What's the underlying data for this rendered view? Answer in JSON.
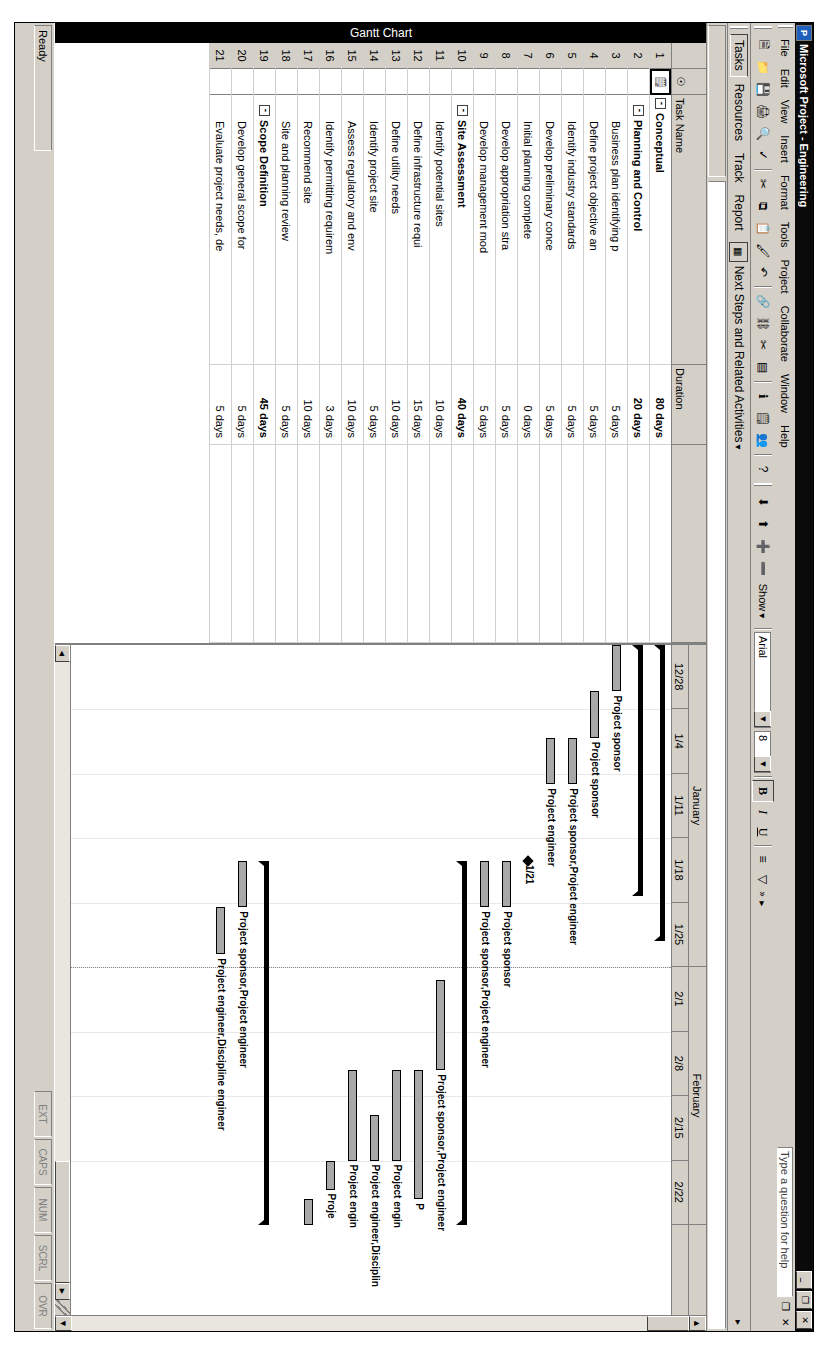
{
  "window": {
    "title": "Microsoft Project - Engineering",
    "app_icon": "project-icon",
    "minimize_label": "_",
    "restore_label": "❐",
    "close_label": "✕"
  },
  "menubar": {
    "items": [
      "File",
      "Edit",
      "View",
      "Insert",
      "Format",
      "Tools",
      "Project",
      "Collaborate",
      "Window",
      "Help"
    ],
    "ask_a_question": "Type a question for help",
    "doc_restore_label": "❐",
    "doc_close_label": "✕",
    "overflow_label": "»"
  },
  "standard_toolbar": {
    "buttons": [
      {
        "name": "new-icon",
        "glyph": "⬜"
      },
      {
        "name": "open-icon",
        "glyph": "🗁"
      },
      {
        "name": "save-icon",
        "glyph": "💾"
      },
      {
        "name": "print-icon",
        "glyph": "🖨"
      },
      {
        "name": "print-preview-icon",
        "glyph": "🔍"
      },
      {
        "name": "spelling-icon",
        "glyph": "✓"
      },
      {
        "name": "cut-icon",
        "glyph": "✂"
      },
      {
        "name": "copy-icon",
        "glyph": "⧉"
      },
      {
        "name": "paste-icon",
        "glyph": "📋"
      },
      {
        "name": "format-painter-icon",
        "glyph": "🖌"
      },
      {
        "name": "undo-icon",
        "glyph": "↶"
      },
      {
        "name": "hyperlink-icon",
        "glyph": "🔗"
      },
      {
        "name": "link-tasks-icon",
        "glyph": "⛓"
      },
      {
        "name": "unlink-tasks-icon",
        "glyph": "✂"
      },
      {
        "name": "split-task-icon",
        "glyph": "▤"
      },
      {
        "name": "task-information-icon",
        "glyph": "ℹ"
      },
      {
        "name": "task-notes-icon",
        "glyph": "🗒"
      },
      {
        "name": "assign-resources-icon",
        "glyph": "👥"
      },
      {
        "name": "help-icon",
        "glyph": "?"
      }
    ],
    "overflow_label": "»"
  },
  "formatting_toolbar": {
    "outdent_icon": "⬇",
    "indent_icon": "⬆",
    "show_subtasks_icon": "➕",
    "hide_subtasks_icon": "➖",
    "show_label": "Show",
    "font_name": "Arial",
    "font_size": "8",
    "bold_label": "B",
    "italic_label": "I",
    "underline_label": "U",
    "align_icon": "≡",
    "filter_icon": "▽",
    "overflow_label": "»"
  },
  "project_guide": {
    "tabs": [
      "Tasks",
      "Resources",
      "Track",
      "Report"
    ],
    "active_tab": "Tasks",
    "guide_icon": "project-guide-icon",
    "next_steps_label": "Next Steps and Related Activities",
    "dropdown_glyph": "▾"
  },
  "view": {
    "active_view_label": "Gantt Chart"
  },
  "grid": {
    "columns": [
      {
        "key": "indicator",
        "label": "🛈",
        "name": "indicators-column"
      },
      {
        "key": "name",
        "label": "Task Name",
        "name": "task-name-column"
      },
      {
        "key": "duration",
        "label": "Duration",
        "name": "duration-column"
      }
    ],
    "selected_cell": {
      "row": 1,
      "column": "indicator"
    },
    "selected_indicator_glyph": "🗒",
    "rows": [
      {
        "id": "1",
        "name": "Conceptual",
        "duration": "80 days",
        "level": 1,
        "summary": true,
        "outline": "-"
      },
      {
        "id": "2",
        "name": "Planning and Control",
        "duration": "20 days",
        "level": 2,
        "summary": true,
        "outline": "-"
      },
      {
        "id": "3",
        "name": "Business plan identifying p",
        "duration": "5 days",
        "level": 3,
        "summary": false,
        "outline": ""
      },
      {
        "id": "4",
        "name": "Define project objective an",
        "duration": "5 days",
        "level": 3,
        "summary": false,
        "outline": ""
      },
      {
        "id": "5",
        "name": "Identify industry standards",
        "duration": "5 days",
        "level": 3,
        "summary": false,
        "outline": ""
      },
      {
        "id": "6",
        "name": "Develop preliminary conce",
        "duration": "5 days",
        "level": 3,
        "summary": false,
        "outline": ""
      },
      {
        "id": "7",
        "name": "Initial planning complete",
        "duration": "0 days",
        "level": 3,
        "summary": false,
        "outline": ""
      },
      {
        "id": "8",
        "name": "Develop appropriation stra",
        "duration": "5 days",
        "level": 3,
        "summary": false,
        "outline": ""
      },
      {
        "id": "9",
        "name": "Develop management mod",
        "duration": "5 days",
        "level": 3,
        "summary": false,
        "outline": ""
      },
      {
        "id": "10",
        "name": "Site Assessment",
        "duration": "40 days",
        "level": 2,
        "summary": true,
        "outline": "-"
      },
      {
        "id": "11",
        "name": "Identify potential sites",
        "duration": "10 days",
        "level": 3,
        "summary": false,
        "outline": ""
      },
      {
        "id": "12",
        "name": "Define infrastructure requi",
        "duration": "15 days",
        "level": 3,
        "summary": false,
        "outline": ""
      },
      {
        "id": "13",
        "name": "Define utility needs",
        "duration": "10 days",
        "level": 3,
        "summary": false,
        "outline": ""
      },
      {
        "id": "14",
        "name": "Identify project site",
        "duration": "5 days",
        "level": 3,
        "summary": false,
        "outline": ""
      },
      {
        "id": "15",
        "name": "Assess regulatory and env",
        "duration": "10 days",
        "level": 3,
        "summary": false,
        "outline": ""
      },
      {
        "id": "16",
        "name": "Identify permitting requirem",
        "duration": "3 days",
        "level": 3,
        "summary": false,
        "outline": ""
      },
      {
        "id": "17",
        "name": "Recommend site",
        "duration": "10 days",
        "level": 3,
        "summary": false,
        "outline": ""
      },
      {
        "id": "18",
        "name": "Site and planning review",
        "duration": "5 days",
        "level": 3,
        "summary": false,
        "outline": ""
      },
      {
        "id": "19",
        "name": "Scope Definition",
        "duration": "45 days",
        "level": 2,
        "summary": true,
        "outline": "-"
      },
      {
        "id": "20",
        "name": "Develop general scope for",
        "duration": "5 days",
        "level": 3,
        "summary": false,
        "outline": ""
      },
      {
        "id": "21",
        "name": "Evaluate project needs, de",
        "duration": "5 days",
        "level": 3,
        "summary": false,
        "outline": ""
      }
    ]
  },
  "chart_data": {
    "type": "gantt",
    "title": "Gantt Chart",
    "timescale": {
      "major": [
        {
          "label": "January",
          "start_week": 0,
          "weeks": 5
        },
        {
          "label": "February",
          "start_week": 5,
          "weeks": 4
        }
      ],
      "minor": [
        "12/28",
        "1/4",
        "1/11",
        "1/18",
        "1/25",
        "2/1",
        "2/8",
        "2/15",
        "2/22"
      ],
      "units": "weeks"
    },
    "milestone_label": "1/21",
    "bars": [
      {
        "row": 1,
        "type": "summary",
        "start": 0.0,
        "end": 4.6,
        "label": ""
      },
      {
        "row": 2,
        "type": "summary",
        "start": 0.0,
        "end": 3.9,
        "label": ""
      },
      {
        "row": 3,
        "type": "task",
        "start": 0.0,
        "end": 0.72,
        "label": "Project sponsor"
      },
      {
        "row": 4,
        "type": "task",
        "start": 0.72,
        "end": 1.44,
        "label": "Project sponsor"
      },
      {
        "row": 5,
        "type": "task",
        "start": 1.44,
        "end": 2.16,
        "label": "Project sponsor,Project engineer"
      },
      {
        "row": 6,
        "type": "task",
        "start": 1.44,
        "end": 2.16,
        "label": "Project engineer"
      },
      {
        "row": 7,
        "type": "milestone",
        "start": 3.35,
        "end": 3.35,
        "label": "1/21"
      },
      {
        "row": 8,
        "type": "task",
        "start": 3.35,
        "end": 4.07,
        "label": "Project sponsor"
      },
      {
        "row": 9,
        "type": "task",
        "start": 3.35,
        "end": 4.07,
        "label": "Project sponsor,Project engineer"
      },
      {
        "row": 10,
        "type": "summary",
        "start": 3.35,
        "end": 9.0,
        "label": ""
      },
      {
        "row": 11,
        "type": "task",
        "start": 5.2,
        "end": 6.6,
        "label": "Project sponsor,Project engineer"
      },
      {
        "row": 12,
        "type": "task",
        "start": 6.6,
        "end": 8.6,
        "label": "P"
      },
      {
        "row": 13,
        "type": "task",
        "start": 6.6,
        "end": 8.0,
        "label": "Project engin"
      },
      {
        "row": 14,
        "type": "task",
        "start": 7.3,
        "end": 8.0,
        "label": "Project engineer,Disciplin"
      },
      {
        "row": 15,
        "type": "task",
        "start": 6.6,
        "end": 8.0,
        "label": "Project engin"
      },
      {
        "row": 16,
        "type": "task",
        "start": 8.0,
        "end": 8.45,
        "label": "Proje"
      },
      {
        "row": 17,
        "type": "task",
        "start": 8.6,
        "end": 9.0,
        "label": ""
      },
      {
        "row": 18,
        "type": "task",
        "start": 0,
        "end": 0,
        "label": ""
      },
      {
        "row": 19,
        "type": "summary",
        "start": 3.35,
        "end": 9.0,
        "label": ""
      },
      {
        "row": 20,
        "type": "task",
        "start": 3.35,
        "end": 4.07,
        "label": "Project sponsor,Project engineer"
      },
      {
        "row": 21,
        "type": "task",
        "start": 4.07,
        "end": 4.8,
        "label": "Project engineer,Discipline engineer"
      }
    ],
    "resource_labels": [
      "Project sponsor",
      "Project sponsor,Project engineer",
      "Project engineer",
      "Project engineer,Discipline engineer"
    ],
    "grid": true,
    "legend": "none"
  },
  "statusbar": {
    "ready": "Ready",
    "indicators": [
      "EXT",
      "CAPS",
      "NUM",
      "SCRL",
      "OVR"
    ]
  }
}
